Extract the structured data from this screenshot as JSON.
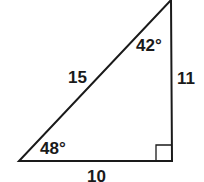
{
  "diagram": {
    "type": "right-triangle",
    "sides": {
      "hypotenuse": "15",
      "vertical_leg": "11",
      "horizontal_leg": "10"
    },
    "angles": {
      "top": "42°",
      "bottom_left": "48°",
      "bottom_right": "right-angle"
    },
    "colors": {
      "stroke": "#1a1a1a",
      "background": "#ffffff"
    }
  }
}
